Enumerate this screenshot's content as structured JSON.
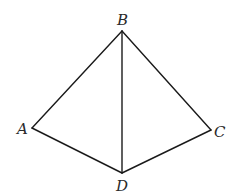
{
  "diagram": {
    "type": "geometry-figure",
    "vertices": {
      "A": {
        "label": "A",
        "x": 32,
        "y": 128
      },
      "B": {
        "label": "B",
        "x": 122,
        "y": 31
      },
      "C": {
        "label": "C",
        "x": 211,
        "y": 130
      },
      "D": {
        "label": "D",
        "x": 122,
        "y": 173
      }
    },
    "edges": [
      [
        "A",
        "B"
      ],
      [
        "B",
        "C"
      ],
      [
        "C",
        "D"
      ],
      [
        "D",
        "A"
      ],
      [
        "B",
        "D"
      ]
    ],
    "labels": {
      "A": "A",
      "B": "B",
      "C": "C",
      "D": "D"
    },
    "colors": {
      "line": "#1a1a1a",
      "label": "#2a2a2a",
      "background": "#ffffff"
    }
  }
}
